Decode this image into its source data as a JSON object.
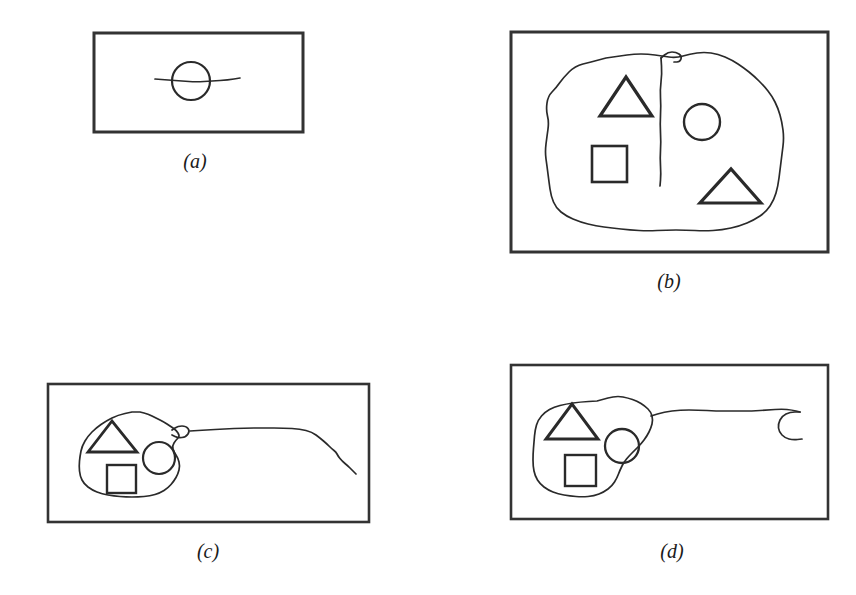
{
  "figure": {
    "kind": "hand-drawn-diagram",
    "background_color": "#ffffff",
    "ink_color": "#2a2a2a",
    "frame_color": "#333333",
    "width": 856,
    "height": 595
  },
  "panels": [
    {
      "id": "a",
      "caption": "(a)",
      "caption_x": 195,
      "caption_y": 150,
      "frame": {
        "x": 94,
        "y": 33,
        "w": 209,
        "h": 99,
        "stroke_width": 3
      },
      "contents": {
        "blob": null,
        "shapes": [
          {
            "type": "circle",
            "cx": 191,
            "cy": 81,
            "r": 19,
            "stroke_width": 2.2
          }
        ],
        "trail": {
          "description": "horizontal sketch line crossing the circle",
          "points": "155,79 168,80 182,81 196,82 212,81 228,80 240,78"
        },
        "hook": null
      }
    },
    {
      "id": "b",
      "caption": "(b)",
      "caption_x": 669,
      "caption_y": 270,
      "frame": {
        "x": 511,
        "y": 32,
        "w": 317,
        "h": 220,
        "stroke_width": 3
      },
      "contents": {
        "blob": {
          "description": "large irregular closed region filling most of the frame",
          "points": "591,62 575,66 563,78 556,88 548,96 546,110 549,122 547,136 545,152 547,166 549,182 551,196 556,208 566,216 580,222 596,226 612,228 630,230 648,231 666,230 686,230 704,231 722,230 740,226 754,220 766,212 774,200 778,186 780,170 782,154 784,138 782,122 778,108 772,96 764,86 754,76 744,68 732,60 718,54 704,52 690,54 676,58 662,56 648,54 634,54 620,56 606,58"
        },
        "divider": {
          "description": "vertical stroke descending from the top of the blob, splitting it",
          "points": "661,58 662,74 660,90 661,106 660,124 661,142 660,158 661,174 660,186"
        },
        "flag": {
          "description": "small hooked flick at the top of the divider",
          "points": "661,58 668,52 676,52 682,56 680,62 674,62"
        },
        "shapes": [
          {
            "type": "triangle",
            "x1": 600,
            "y1": 116,
            "x2": 652,
            "y2": 116,
            "x3": 626,
            "y3": 77,
            "stroke_width": 3.2
          },
          {
            "type": "square",
            "x": 592,
            "y": 146,
            "w": 35,
            "h": 36,
            "stroke_width": 2.6
          },
          {
            "type": "circle",
            "cx": 702,
            "cy": 122,
            "r": 18,
            "stroke_width": 2.4
          },
          {
            "type": "triangle",
            "x1": 700,
            "y1": 203,
            "x2": 761,
            "y2": 203,
            "x3": 731,
            "y3": 169,
            "stroke_width": 3.2
          }
        ],
        "trail": null,
        "hook": null
      }
    },
    {
      "id": "c",
      "caption": "(c)",
      "caption_x": 208,
      "caption_y": 540,
      "frame": {
        "x": 48,
        "y": 384,
        "w": 321,
        "h": 138,
        "stroke_width": 2.6
      },
      "contents": {
        "blob": {
          "description": "small irregular closed region on the left containing three shapes",
          "points": "132,412 118,415 106,421 96,428 88,436 82,446 80,456 79,466 80,476 84,484 92,490 102,494 114,496 126,497 138,497 150,496 160,493 168,488 174,481 178,474 180,466 178,458 174,452 172,446 176,440 180,436 176,430 170,426 164,422 156,418 148,414 140,412"
        },
        "notch": {
          "description": "small bump on the blob's right edge where the trail exits",
          "points": "172,430 178,426 186,426 190,431 186,437 178,438 172,435"
        },
        "shapes": [
          {
            "type": "triangle",
            "x1": 88,
            "y1": 452,
            "x2": 137,
            "y2": 452,
            "x3": 112,
            "y3": 421,
            "stroke_width": 2.8
          },
          {
            "type": "circle",
            "cx": 159,
            "cy": 458,
            "r": 16,
            "stroke_width": 2.2
          },
          {
            "type": "square",
            "x": 107,
            "y": 465,
            "w": 29,
            "h": 28,
            "stroke_width": 2.4
          }
        ],
        "trail": {
          "description": "long wavering line running right from the blob toward the frame edge, ending mid-air",
          "points": "190,431 206,430 224,429 244,428 264,428 284,428 300,429 312,432 320,438 327,444 332,449 336,452 338,456 342,461 348,466 352,470 356,474"
        },
        "hook": null
      }
    },
    {
      "id": "d",
      "caption": "(d)",
      "caption_x": 672,
      "caption_y": 540,
      "frame": {
        "x": 511,
        "y": 365,
        "w": 317,
        "h": 154,
        "stroke_width": 2.6
      },
      "contents": {
        "blob": {
          "description": "irregular closed region on the left containing three shapes",
          "points": "597,401 580,402 566,404 554,407 545,412 538,420 535,430 534,442 533,454 533,466 535,476 540,484 548,490 558,494 570,496 582,497 594,496 604,492 612,486 617,478 620,470 624,462 629,456 635,450 641,444 647,436 651,428 653,420 651,412 645,406 637,401 628,398 618,396 608,398"
        },
        "shapes": [
          {
            "type": "triangle",
            "x1": 546,
            "y1": 439,
            "x2": 598,
            "y2": 439,
            "x3": 572,
            "y3": 404,
            "stroke_width": 3.0
          },
          {
            "type": "circle",
            "cx": 622,
            "cy": 446,
            "r": 17,
            "stroke_width": 2.3
          },
          {
            "type": "square",
            "x": 565,
            "y": 455,
            "w": 31,
            "h": 31,
            "stroke_width": 2.4
          }
        ],
        "trail": {
          "description": "long wavering line running right from the blob to a curled hook near the frame edge",
          "points": "651,416 664,412 680,410 698,410 716,411 734,411 752,411 768,410 782,409 792,410 800,412"
        },
        "hook": {
          "description": "open curl (backwards C) at the end of the trail",
          "points": "800,412 790,412 782,416 778,424 779,432 785,438 793,440 802,439"
        }
      }
    }
  ]
}
